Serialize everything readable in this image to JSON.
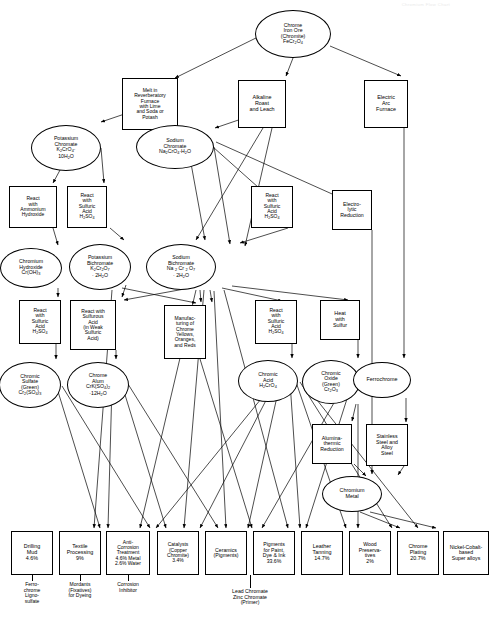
{
  "header": {
    "watermark": "Chromium Flow Chart"
  },
  "diagram": {
    "type": "process-flow-diagram",
    "nodes": [
      {
        "id": "chrome_ore",
        "shape": "ellipse",
        "x": 293,
        "y": 10,
        "w": 76,
        "h": 48,
        "font": 5.2,
        "html": "Chrome<br>Iron Ore<br>(Chromite)<br>FeCr<sub>2</sub>O<sub>4</sub>",
        "text": "Chrome Iron Ore (Chromite) FeCr2O4"
      },
      {
        "id": "melt_reverb",
        "shape": "box",
        "x": 150,
        "y": 78,
        "w": 56,
        "h": 52,
        "font": 5.0,
        "html": "Melt in<br>Reverberatory<br>Furnace<br>with Lime<br>and Soda or<br>Potash",
        "text": "Melt in Reverberatory Furnace with Lime and Soda or Potash"
      },
      {
        "id": "alkaline_roast",
        "shape": "box",
        "x": 262,
        "y": 80,
        "w": 48,
        "h": 48,
        "font": 5.4,
        "html": "Alkaline<br>Roast<br>and Leach",
        "text": "Alkaline Roast and Leach"
      },
      {
        "id": "electric_arc",
        "shape": "box",
        "x": 386,
        "y": 80,
        "w": 44,
        "h": 48,
        "font": 5.4,
        "html": "Electric<br>Arc<br>Furnace",
        "text": "Electric Arc Furnace"
      },
      {
        "id": "potassium_chromate",
        "shape": "ellipse",
        "x": 66,
        "y": 125,
        "w": 70,
        "h": 46,
        "font": 5.2,
        "html": "Potassium<br>Chromate<br>K<sub>2</sub>CrO<sub>4</sub>·<br>10H<sub>2</sub>O",
        "text": "Potassium Chromate K2CrO4 10H2O"
      },
      {
        "id": "sodium_chromate",
        "shape": "ellipse",
        "x": 175,
        "y": 125,
        "w": 78,
        "h": 44,
        "font": 5.2,
        "html": "Sodium<br>Chromate<br>Na<sub>2</sub>CrO<sub>4</sub>·H<sub>2</sub>O",
        "text": "Sodium Chromate Na2CrO4 H2O"
      },
      {
        "id": "react_ammonium",
        "shape": "box",
        "x": 33,
        "y": 186,
        "w": 48,
        "h": 42,
        "font": 5.0,
        "html": "React<br>with<br>Ammonium<br>Hydroxide",
        "text": "React with Ammonium Hydroxide"
      },
      {
        "id": "react_h2so4_a",
        "shape": "box",
        "x": 87,
        "y": 186,
        "w": 40,
        "h": 42,
        "font": 5.0,
        "html": "React<br>with<br>Sulfuric<br>Acid<br>H<sub>2</sub>SO<sub>4</sub>",
        "text": "React with Sulfuric Acid H2SO4"
      },
      {
        "id": "react_h2so4_b",
        "shape": "box",
        "x": 272,
        "y": 186,
        "w": 42,
        "h": 42,
        "font": 5.0,
        "html": "React<br>with<br>Sulfuric<br>Acid<br>H<sub>2</sub>SO<sub>4</sub>",
        "text": "React with Sulfuric Acid H2SO4"
      },
      {
        "id": "electrolytic",
        "shape": "box",
        "x": 352,
        "y": 190,
        "w": 40,
        "h": 40,
        "font": 5.2,
        "html": "Electro-<br>lytic<br>Reduction",
        "text": "Electrolytic Reduction"
      },
      {
        "id": "chromium_hydroxide",
        "shape": "ellipse",
        "x": 31,
        "y": 248,
        "w": 62,
        "h": 40,
        "font": 5.2,
        "html": "Chromium<br>Hydroxide<br>Cr(OH)<sub>3</sub>",
        "text": "Chromium Hydroxide Cr(OH)3"
      },
      {
        "id": "potassium_bichrom",
        "shape": "ellipse",
        "x": 100,
        "y": 244,
        "w": 62,
        "h": 46,
        "font": 5.2,
        "html": "Potassium<br>Bichromate<br>K<sub>2</sub>Cr<sub>2</sub>O<sub>7</sub><br>· 2H<sub>2</sub>O",
        "text": "Potassium Bichromate K2Cr2O7 2H2O"
      },
      {
        "id": "sodium_bichrom",
        "shape": "ellipse",
        "x": 181,
        "y": 244,
        "w": 70,
        "h": 46,
        "font": 5.2,
        "html": "Sodium<br>Bichromate<br>Na <sub>2</sub> Cr <sub>2</sub> O<sub>7</sub><br>· 2H<sub>2</sub>O",
        "text": "Sodium Bichromate Na2Cr2O7 2H2O"
      },
      {
        "id": "react_h2so4_c",
        "shape": "box",
        "x": 40,
        "y": 300,
        "w": 42,
        "h": 44,
        "font": 5.0,
        "html": "React<br>with<br>Sulfuric<br>Acid<br>H<sub>2</sub>SO<sub>4</sub>",
        "text": "React with Sulfuric Acid H2SO4"
      },
      {
        "id": "react_sulfurous",
        "shape": "box",
        "x": 93,
        "y": 300,
        "w": 46,
        "h": 50,
        "font": 5.0,
        "html": "React with<br>Sulfurous<br>Acid<br>(in Weak<br>Sulfuric<br>Acid)",
        "text": "React with Sulfurous Acid (in Weak Sulfuric Acid)"
      },
      {
        "id": "manufacturing",
        "shape": "box",
        "x": 185,
        "y": 305,
        "w": 42,
        "h": 54,
        "font": 5.0,
        "html": "Manufac-<br>turing of<br>Chrome<br>Yellows,<br>Oranges,<br>and Reds",
        "text": "Manufacturing of Chrome Yellows, Oranges, and Reds"
      },
      {
        "id": "react_h2so4_d",
        "shape": "box",
        "x": 276,
        "y": 300,
        "w": 42,
        "h": 44,
        "font": 5.0,
        "html": "React<br>with<br>Sulfuric<br>Acid<br>H<sub>2</sub>SO<sub>4</sub>",
        "text": "React with Sulfuric Acid H2SO4"
      },
      {
        "id": "heat_sulfur",
        "shape": "box",
        "x": 340,
        "y": 300,
        "w": 40,
        "h": 40,
        "font": 5.4,
        "html": "Heat<br>with<br>Sulfur",
        "text": "Heat with Sulfur"
      },
      {
        "id": "chromic_sulfate",
        "shape": "ellipse",
        "x": 30,
        "y": 362,
        "w": 62,
        "h": 46,
        "font": 5.2,
        "html": "Chromic<br>Sulfate<br>(Green)<br>Cr<sub>2</sub>(SO<sub>4</sub>)<sub>3</sub>",
        "text": "Chromic Sulfate (Green) Cr2(SO4)3"
      },
      {
        "id": "chrome_alum",
        "shape": "ellipse",
        "x": 98,
        "y": 362,
        "w": 62,
        "h": 46,
        "font": 5.2,
        "html": "Chrome<br>Alum<br>CrK(SO<sub>4</sub>)<sub>2</sub><br>·12H<sub>2</sub>O",
        "text": "Chrome Alum CrK(SO4)2 12H2O"
      },
      {
        "id": "chromic_acid",
        "shape": "ellipse",
        "x": 268,
        "y": 360,
        "w": 60,
        "h": 42,
        "font": 5.2,
        "html": "Chromic<br>Acid<br>H<sub>2</sub>CrO<sub>4</sub>",
        "text": "Chromic Acid H2CrO4"
      },
      {
        "id": "chromic_oxide",
        "shape": "ellipse",
        "x": 331,
        "y": 360,
        "w": 58,
        "h": 44,
        "font": 5.2,
        "html": "Chromic<br>Oxide<br>(Green)<br>Cr<sub>2</sub>O<sub>3</sub>",
        "text": "Chromic Oxide (Green) Cr2O3"
      },
      {
        "id": "ferrochrome",
        "shape": "ellipse",
        "x": 382,
        "y": 362,
        "w": 58,
        "h": 36,
        "font": 5.4,
        "html": "Ferrochrome",
        "text": "Ferrochrome"
      },
      {
        "id": "alumina_thermic",
        "shape": "box",
        "x": 332,
        "y": 424,
        "w": 40,
        "h": 40,
        "font": 5.2,
        "html": "Alumina-<br>thermic<br>Reduction",
        "text": "Alumina-thermic Reduction"
      },
      {
        "id": "stainless_steel",
        "shape": "box",
        "x": 387,
        "y": 424,
        "w": 42,
        "h": 42,
        "font": 5.2,
        "html": "Stainless<br>Steel and<br>Alloy<br>Steel",
        "text": "Stainless Steel and Alloy Steel"
      },
      {
        "id": "chromium_metal",
        "shape": "ellipse",
        "x": 352,
        "y": 476,
        "w": 60,
        "h": 36,
        "font": 5.4,
        "html": "Chromium<br>Metal",
        "text": "Chromium Metal"
      }
    ],
    "end_products": [
      {
        "id": "drilling_mud",
        "x": 32,
        "w": 42,
        "font": 5.4,
        "html": "Drilling<br>Mud<br>4.6%",
        "text": "Drilling Mud 4.6%",
        "caption": "Ferro-<br>chrome<br>Ligno-<br>sulfate",
        "caption_text": "Ferrochrome Lignosulfate"
      },
      {
        "id": "textile",
        "x": 80,
        "w": 42,
        "font": 5.4,
        "html": "Textile<br>Processing<br>9%",
        "text": "Textile Processing 9%",
        "caption": "Mordants<br>(Fixatives)<br>for Dyeing",
        "caption_text": "Mordants (Fixatives) for Dyeing"
      },
      {
        "id": "anticorrosion",
        "x": 128,
        "w": 44,
        "font": 5.0,
        "html": "Anti-<br>Corrosion<br>Treatment<br>4.6% Metal<br>2.6% Water",
        "text": "Anti-Corrosion Treatment 4.6% Metal 2.6% Water",
        "caption": "Corrosion<br>Inhibitor",
        "caption_text": "Corrosion Inhibitor"
      },
      {
        "id": "catalysts",
        "x": 178,
        "w": 42,
        "font": 5.0,
        "html": "Catalysts<br>(Copper<br>Chromite)<br>3.4%",
        "text": "Catalysts (Copper Chromite) 3.4%",
        "caption": "",
        "caption_text": ""
      },
      {
        "id": "ceramics",
        "x": 226,
        "w": 42,
        "font": 5.2,
        "html": "Ceramics<br>(Pigments)",
        "text": "Ceramics (Pigments)",
        "caption": "",
        "caption_text": ""
      },
      {
        "id": "pigments",
        "x": 274,
        "w": 42,
        "font": 5.2,
        "html": "Pigments<br>for Paint,<br>Dye &amp; Ink<br>33.6%",
        "text": "Pigments for Paint, Dye & Ink 33.6%",
        "caption": "",
        "caption_text": ""
      },
      {
        "id": "leather",
        "x": 322,
        "w": 42,
        "font": 5.4,
        "html": "Leather<br>Tanning<br>14.7%",
        "text": "Leather Tanning 14.7%",
        "caption": "",
        "caption_text": ""
      },
      {
        "id": "wood",
        "x": 370,
        "w": 42,
        "font": 5.2,
        "html": "Wood<br>Preserva-<br>tives<br>2%",
        "text": "Wood Preservatives 2%",
        "caption": "",
        "caption_text": ""
      },
      {
        "id": "chrome_plating",
        "x": 418,
        "w": 42,
        "font": 5.4,
        "html": "Chrome<br>Plating<br>20.7%",
        "text": "Chrome Plating 20.7%",
        "caption": "",
        "caption_text": ""
      },
      {
        "id": "nickel_cobalt",
        "x": 466,
        "w": 46,
        "font": 5.2,
        "html": "Nickel-Cobalt-<br>based<br>Super alloys",
        "text": "Nickel-Cobalt-based Super alloys",
        "caption": "",
        "caption_text": ""
      }
    ],
    "shared_caption": {
      "html": "Lead Chromate<br>Zinc Chromate<br>(Primer)",
      "text": "Lead Chromate Zinc Chromate (Primer)",
      "x": 250,
      "y": 589
    },
    "end_row": {
      "y": 531,
      "h": 44
    },
    "edges": [
      [
        "chrome_ore",
        "melt_reverb"
      ],
      [
        "chrome_ore",
        "alkaline_roast"
      ],
      [
        "chrome_ore",
        "electric_arc"
      ],
      [
        "melt_reverb",
        "potassium_chromate"
      ],
      [
        "melt_reverb",
        "sodium_chromate"
      ],
      [
        "alkaline_roast",
        "sodium_chromate"
      ],
      [
        "alkaline_roast",
        "sodium_bichrom"
      ],
      [
        "alkaline_roast",
        "react_h2so4_b"
      ],
      [
        "potassium_chromate",
        "react_ammonium"
      ],
      [
        "potassium_chromate",
        "react_h2so4_a"
      ],
      [
        "sodium_chromate",
        "sodium_bichrom"
      ],
      [
        "sodium_chromate",
        "react_h2so4_b"
      ],
      [
        "sodium_chromate",
        "electrolytic"
      ],
      [
        "react_ammonium",
        "chromium_hydroxide"
      ],
      [
        "react_h2so4_a",
        "potassium_bichrom"
      ],
      [
        "react_h2so4_b",
        "sodium_bichrom"
      ],
      [
        "chromium_hydroxide",
        "react_h2so4_c"
      ],
      [
        "potassium_bichrom",
        "react_sulfurous"
      ],
      [
        "potassium_bichrom",
        "manufacturing"
      ],
      [
        "sodium_bichrom",
        "react_sulfurous"
      ],
      [
        "sodium_bichrom",
        "manufacturing"
      ],
      [
        "sodium_bichrom",
        "react_h2so4_d"
      ],
      [
        "sodium_bichrom",
        "heat_sulfur"
      ],
      [
        "react_h2so4_c",
        "chromic_sulfate"
      ],
      [
        "react_sulfurous",
        "chrome_alum"
      ],
      [
        "react_h2so4_d",
        "chromic_acid"
      ],
      [
        "heat_sulfur",
        "chromic_oxide"
      ],
      [
        "electric_arc",
        "ferrochrome"
      ],
      [
        "electric_arc",
        "stainless_steel"
      ],
      [
        "chromic_oxide",
        "alumina_thermic"
      ],
      [
        "ferrochrome",
        "stainless_steel"
      ],
      [
        "alumina_thermic",
        "chromium_metal"
      ],
      [
        "electrolytic",
        "chromium_metal"
      ]
    ]
  }
}
